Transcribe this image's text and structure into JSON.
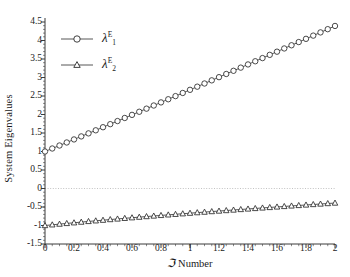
{
  "chart_data": {
    "type": "line",
    "title": "",
    "xlabel": "ℑ Number",
    "xlabel_symbol": "ℑ",
    "xlabel_suffix": " Number",
    "ylabel": "System Eigenvalues",
    "xlim": [
      0,
      2
    ],
    "ylim": [
      -1.5,
      4.5
    ],
    "xticks": [
      0,
      0.2,
      0.4,
      0.6,
      0.8,
      1,
      1.2,
      1.4,
      1.6,
      1.8,
      2
    ],
    "xtick_labels": [
      "0",
      "0.2",
      "0.4",
      "0.6",
      "0.8",
      "1",
      "1.2",
      "1.4",
      "1.6",
      "1.8",
      "2"
    ],
    "yticks": [
      -1.5,
      -1,
      -0.5,
      0,
      0.5,
      1,
      1.5,
      2,
      2.5,
      3,
      3.5,
      4,
      4.5
    ],
    "ytick_labels": [
      "-1.5",
      "-1",
      "-0.5",
      "0",
      "0.5",
      "1",
      "1.5",
      "2",
      "2.5",
      "3",
      "3.5",
      "4",
      "4.5"
    ],
    "grid": false,
    "zero_line": true,
    "zero_line_color": "#bbbbbb",
    "zero_line_style": "dotted",
    "legend_position": "upper-left-inside",
    "line_color": "#2b2b2b",
    "x": [
      0,
      0.05,
      0.1,
      0.15,
      0.2,
      0.25,
      0.3,
      0.35,
      0.4,
      0.45,
      0.5,
      0.55,
      0.6,
      0.65,
      0.7,
      0.75,
      0.8,
      0.85,
      0.9,
      0.95,
      1,
      1.05,
      1.1,
      1.15,
      1.2,
      1.25,
      1.3,
      1.35,
      1.4,
      1.45,
      1.5,
      1.55,
      1.6,
      1.65,
      1.7,
      1.75,
      1.8,
      1.85,
      1.9,
      1.95,
      2
    ],
    "series": [
      {
        "name": "λ₁ᴱ",
        "label_base": "λ",
        "label_sub": "1",
        "label_sup": "E",
        "marker": "circle",
        "color": "#2b2b2b",
        "values": [
          1.0,
          1.081,
          1.162,
          1.244,
          1.326,
          1.408,
          1.49,
          1.573,
          1.656,
          1.739,
          1.823,
          1.906,
          1.99,
          2.074,
          2.158,
          2.243,
          2.327,
          2.412,
          2.497,
          2.582,
          2.667,
          2.752,
          2.838,
          2.923,
          3.009,
          3.095,
          3.181,
          3.267,
          3.353,
          3.439,
          3.525,
          3.612,
          3.698,
          3.785,
          3.871,
          3.958,
          4.045,
          4.132,
          4.219,
          4.306,
          4.393
        ]
      },
      {
        "name": "λ₂ᴱ",
        "label_base": "λ",
        "label_sub": "2",
        "label_sup": "E",
        "marker": "triangle",
        "color": "#2b2b2b",
        "values": [
          -1.0,
          -0.981,
          -0.962,
          -0.944,
          -0.926,
          -0.908,
          -0.89,
          -0.873,
          -0.856,
          -0.839,
          -0.823,
          -0.806,
          -0.79,
          -0.774,
          -0.758,
          -0.743,
          -0.727,
          -0.712,
          -0.697,
          -0.682,
          -0.667,
          -0.652,
          -0.638,
          -0.623,
          -0.609,
          -0.595,
          -0.581,
          -0.567,
          -0.553,
          -0.539,
          -0.525,
          -0.512,
          -0.498,
          -0.485,
          -0.471,
          -0.458,
          -0.445,
          -0.432,
          -0.419,
          -0.406,
          -0.393
        ]
      }
    ]
  },
  "legend": {
    "items": [
      {
        "sub": "1",
        "sup": "E",
        "base": "λ"
      },
      {
        "sub": "2",
        "sup": "E",
        "base": "λ"
      }
    ]
  }
}
